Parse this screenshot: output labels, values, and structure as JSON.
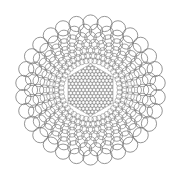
{
  "figure": {
    "label": "Circle packing pattern with hexagonal core",
    "width": 179,
    "height": 181,
    "center": [
      90.5,
      90
    ],
    "stroke_color": "#7a7a7a",
    "background_color": "#ffffff",
    "core": {
      "shape": "hexagon",
      "orientation": "pointy-top",
      "circumradius": 26,
      "lattice_spacing": 3.6,
      "circle_radius": 2.1,
      "stroke_width": 0.45
    },
    "rings": [
      {
        "distance": 29.5,
        "count": 42,
        "circle_radius": 3.0,
        "stroke_width": 0.5
      },
      {
        "distance": 34.5,
        "count": 42,
        "circle_radius": 3.6,
        "stroke_width": 0.55
      },
      {
        "distance": 40.0,
        "count": 40,
        "circle_radius": 4.3,
        "stroke_width": 0.6
      },
      {
        "distance": 46.0,
        "count": 38,
        "circle_radius": 5.0,
        "stroke_width": 0.65
      },
      {
        "distance": 52.5,
        "count": 36,
        "circle_radius": 5.8,
        "stroke_width": 0.7
      },
      {
        "distance": 59.5,
        "count": 34,
        "circle_radius": 6.6,
        "stroke_width": 0.75
      },
      {
        "distance": 67.5,
        "count": 30,
        "circle_radius": 7.6,
        "stroke_width": 0.8
      }
    ]
  }
}
